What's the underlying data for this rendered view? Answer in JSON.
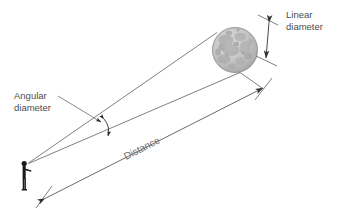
{
  "figure": {
    "title_visible": false,
    "background_color": "#ffffff",
    "line_color": "#555555",
    "text_color": "#4d4d4d",
    "distance_text_color": "#6b6b6b",
    "observer_color": "#1a1a1a",
    "moon_color": "#b8b8b8",
    "moon_shadow_color": "#9a9a9a"
  },
  "labels": {
    "linear_diameter_line1": "Linear",
    "linear_diameter_line2": "diameter",
    "angular_diameter_line1": "Angular",
    "angular_diameter_line2": "diameter",
    "distance": "Distance"
  },
  "elements": {
    "moon_name": "moon-sphere",
    "observer_name": "observer-figure",
    "upper_sight_line": "sight-line-upper",
    "lower_sight_line": "sight-line-lower",
    "distance_arrow": "distance-arrow",
    "linear_diameter_arrow": "linear-diameter-arrow",
    "angular_diameter_arc": "angular-diameter-arc",
    "leader_line": "angular-diameter-leader-line"
  },
  "geometry": {
    "moon_center_x": 235,
    "moon_center_y": 50,
    "moon_radius": 23,
    "observer_x": 28,
    "observer_y": 163
  }
}
